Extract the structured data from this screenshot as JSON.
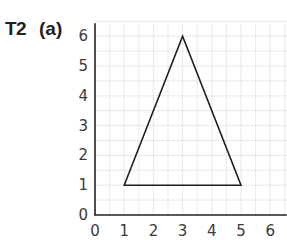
{
  "header": {
    "question_number": "T2",
    "part_label": "(a)"
  },
  "chart_data": {
    "type": "diagram",
    "title": "",
    "xlabel": "",
    "ylabel": "",
    "xlim": [
      0,
      6.5
    ],
    "ylim": [
      0,
      6.5
    ],
    "grid": true,
    "x_ticks": [
      "0",
      "1",
      "2",
      "3",
      "4",
      "5",
      "6"
    ],
    "y_ticks": [
      "0",
      "1",
      "2",
      "3",
      "4",
      "5",
      "6"
    ],
    "shapes": [
      {
        "kind": "triangle",
        "vertices": [
          [
            1,
            1
          ],
          [
            3,
            6
          ],
          [
            5,
            1
          ]
        ]
      }
    ]
  },
  "colors": {
    "axis": "#231f20",
    "grid": "#e3e3e3",
    "shape": "#231f20",
    "text": "#3a3a3a"
  }
}
